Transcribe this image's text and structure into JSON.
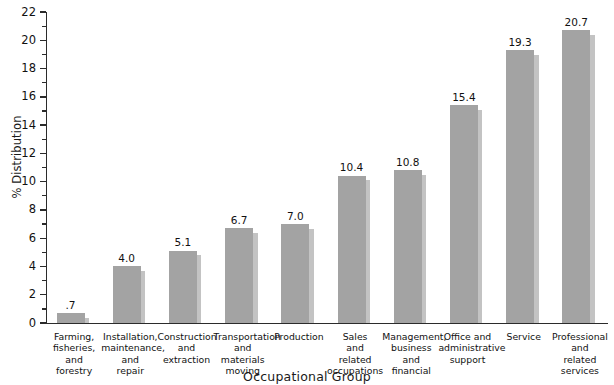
{
  "chart_data": {
    "type": "bar",
    "title": "",
    "xlabel": "Occupational Group",
    "ylabel": "% Distribution",
    "ylim": [
      0,
      22
    ],
    "ytick_step": 2,
    "yminor_step": 1,
    "grid": false,
    "legend": null,
    "bar_color": "#a3a3a3",
    "shadow_color": "#b9b9b9",
    "axis_color": "#2b2b2b",
    "categories": [
      "Farming,\nfisheries,\nand\nforestry",
      "Installation,\nmaintenance,\nand\nrepair",
      "Construction\nand\nextraction",
      "Transportation\nand\nmaterials\nmoving",
      "Production",
      "Sales\nand\nrelated\noccupations",
      "Management,\nbusiness and\nfinancial",
      "Office and\nadministrative\nsupport",
      "Service",
      "Professional\nand\nrelated\nservices"
    ],
    "values": [
      0.7,
      4.0,
      5.1,
      6.7,
      7.0,
      10.4,
      10.8,
      15.4,
      19.3,
      20.7
    ],
    "value_labels": [
      ".7",
      "4.0",
      "5.1",
      "6.7",
      "7.0",
      "10.4",
      "10.8",
      "15.4",
      "19.3",
      "20.7"
    ],
    "ytick_labels": [
      "0",
      "2",
      "4",
      "6",
      "8",
      "10",
      "12",
      "14",
      "16",
      "18",
      "20",
      "22"
    ]
  }
}
